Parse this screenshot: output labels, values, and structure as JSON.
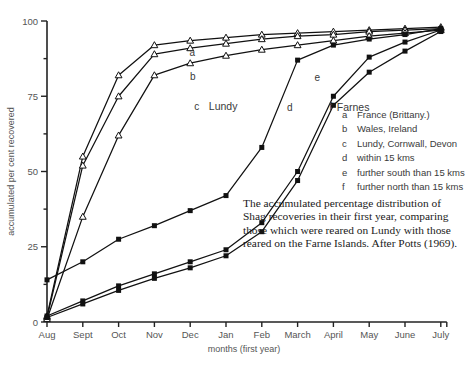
{
  "chart_data": {
    "type": "line",
    "title": "",
    "xlabel": "months (first year)",
    "ylabel": "accumulated per cent recovered",
    "ylim": [
      0,
      100
    ],
    "yticks": [
      0,
      25,
      50,
      75,
      100
    ],
    "ytick_labels": [
      "0",
      "25",
      "50",
      "75",
      "100"
    ],
    "grid": false,
    "legend_position": "right",
    "categories": [
      "Aug",
      "Sept",
      "Oct",
      "Nov",
      "Dec",
      "Jan",
      "Feb",
      "March",
      "April",
      "May",
      "June",
      "July"
    ],
    "series": [
      {
        "name": "a",
        "group": "Lundy",
        "marker": "open-triangle",
        "values": [
          2,
          55,
          82,
          92,
          93.5,
          94.5,
          95.5,
          96,
          96.5,
          97,
          97.5,
          98
        ]
      },
      {
        "name": "b",
        "group": "Lundy",
        "marker": "open-triangle",
        "values": [
          1.5,
          52,
          75,
          89,
          91,
          92.5,
          94,
          95,
          95.5,
          96.5,
          97,
          97.5
        ]
      },
      {
        "name": "c",
        "group": "Lundy",
        "marker": "open-triangle",
        "values": [
          1,
          35,
          62,
          82,
          86,
          88.5,
          90.5,
          92,
          93.5,
          95,
          96,
          97
        ]
      },
      {
        "name": "d",
        "group": "Farnes",
        "marker": "filled-square",
        "values": [
          14,
          20,
          27.5,
          32,
          37,
          42,
          58,
          87,
          92,
          94,
          95.5,
          97.5
        ]
      },
      {
        "name": "e",
        "group": "Farnes",
        "marker": "filled-square",
        "values": [
          2,
          7,
          12,
          16,
          20,
          24,
          33,
          50,
          75,
          88,
          93,
          97
        ]
      },
      {
        "name": "f",
        "group": "Farnes",
        "marker": "filled-square",
        "values": [
          1.5,
          6,
          10.5,
          14.5,
          18,
          22,
          30,
          47,
          72,
          83,
          90,
          96.5
        ]
      }
    ],
    "curve_labels": [
      {
        "key": "a",
        "x": 4.06,
        "y": 88.5
      },
      {
        "key": "b",
        "x": 4.07,
        "y": 80.5
      },
      {
        "key": "c",
        "x": 4.18,
        "y": 70.5
      },
      {
        "key": "d",
        "x": 6.78,
        "y": 70.0
      },
      {
        "key": "e",
        "x": 7.55,
        "y": 80.0
      },
      {
        "key": "f",
        "x": 7.92,
        "y": 70.5
      }
    ],
    "group_labels": [
      {
        "text": "Lundy",
        "x": 4.92,
        "y": 70.5
      },
      {
        "text": "Farnes",
        "x": 8.55,
        "y": 70.0
      }
    ]
  },
  "legend": {
    "entries": [
      {
        "key": "a",
        "label": "France (Brittany.)"
      },
      {
        "key": "b",
        "label": "Wales, Ireland"
      },
      {
        "key": "c",
        "label": "Lundy, Cornwall, Devon"
      },
      {
        "key": "d",
        "label": "within 15 kms"
      },
      {
        "key": "e",
        "label": "further south than 15 kms"
      },
      {
        "key": "f",
        "label": "further north than 15 kms"
      }
    ]
  },
  "caption": {
    "text": "The accumulated percentage distribution of Shag recoveries in their first year, comparing those which were reared on Lundy with those reared on the Farne Islands. After Potts (1969)."
  },
  "colors": {
    "axis": "#222222",
    "line": "#111111",
    "text": "#3a3a3a",
    "background": "#ffffff"
  }
}
